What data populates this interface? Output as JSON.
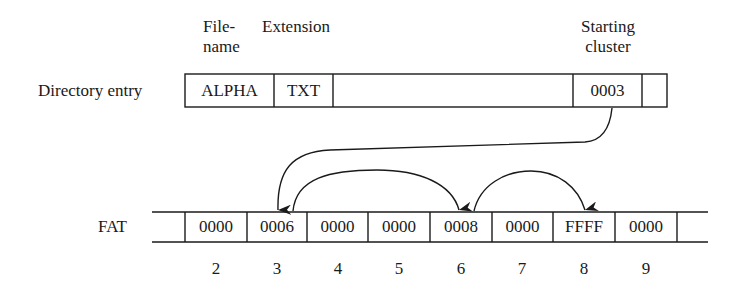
{
  "directory_entry": {
    "row_label": "Directory entry",
    "header_filename_line1": "File-",
    "header_filename_line2": "name",
    "header_extension": "Extension",
    "header_starting_line1": "Starting",
    "header_starting_line2": "cluster",
    "filename": "ALPHA",
    "extension": "TXT",
    "starting_cluster": "0003"
  },
  "fat": {
    "row_label": "FAT",
    "entries": [
      {
        "index": "2",
        "value": "0000"
      },
      {
        "index": "3",
        "value": "0006"
      },
      {
        "index": "4",
        "value": "0000"
      },
      {
        "index": "5",
        "value": "0000"
      },
      {
        "index": "6",
        "value": "0008"
      },
      {
        "index": "7",
        "value": "0000"
      },
      {
        "index": "8",
        "value": "FFFF"
      },
      {
        "index": "9",
        "value": "0000"
      }
    ]
  },
  "chain": {
    "arrows": [
      {
        "from": "starting_cluster",
        "to": "3"
      },
      {
        "from": "3",
        "to": "6"
      },
      {
        "from": "6",
        "to": "8"
      }
    ]
  },
  "colors": {
    "line": "#1a1a1a",
    "background": "#ffffff"
  }
}
